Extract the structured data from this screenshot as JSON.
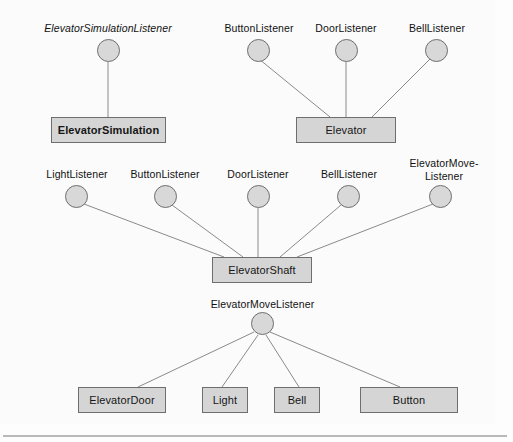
{
  "diagram": {
    "notation": "UML lollipop interface notation",
    "colors": {
      "box_fill": "#d5d5d5",
      "box_stroke": "#6e6e6e",
      "circle_fill": "#d8d8d8",
      "circle_stroke": "#6e6e6e",
      "edge_stroke": "#8a8a8a",
      "background": "#fdfdfd",
      "rule": "#b9b9b9",
      "text": "#161616"
    },
    "groups": [
      {
        "id": "elevator-simulation-group",
        "class_box": {
          "label": "ElevatorSimulation",
          "bold": true
        },
        "interfaces": [
          {
            "label": "ElevatorSimulationListener",
            "italic": true
          }
        ]
      },
      {
        "id": "elevator-group",
        "class_box": {
          "label": "Elevator",
          "bold": false
        },
        "interfaces": [
          {
            "label": "ButtonListener",
            "italic": false
          },
          {
            "label": "DoorListener",
            "italic": false
          },
          {
            "label": "BellListener",
            "italic": false
          }
        ]
      },
      {
        "id": "elevator-shaft-group",
        "class_box": {
          "label": "ElevatorShaft",
          "bold": false
        },
        "interfaces": [
          {
            "label": "LightListener",
            "italic": false
          },
          {
            "label": "ButtonListener",
            "italic": false
          },
          {
            "label": "DoorListener",
            "italic": false
          },
          {
            "label": "BellListener",
            "italic": false
          },
          {
            "label": "ElevatorMove-\nListener",
            "italic": false
          }
        ]
      },
      {
        "id": "elevator-move-listener-group",
        "class_box": null,
        "interfaces": [
          {
            "label": "ElevatorMoveListener",
            "italic": false
          }
        ],
        "implementors": [
          {
            "label": "ElevatorDoor"
          },
          {
            "label": "Light"
          },
          {
            "label": "Bell"
          },
          {
            "label": "Button"
          }
        ]
      }
    ],
    "nodes": {
      "box_elevator_simulation": "ElevatorSimulation",
      "box_elevator": "Elevator",
      "box_elevator_shaft": "ElevatorShaft",
      "box_elevator_door": "ElevatorDoor",
      "box_light": "Light",
      "box_bell": "Bell",
      "box_button": "Button",
      "iface_elevator_simulation_listener": "ElevatorSimulationListener",
      "iface_button_listener_top": "ButtonListener",
      "iface_door_listener_top": "DoorListener",
      "iface_bell_listener_top": "BellListener",
      "iface_light_listener_mid": "LightListener",
      "iface_button_listener_mid": "ButtonListener",
      "iface_door_listener_mid": "DoorListener",
      "iface_bell_listener_mid": "BellListener",
      "iface_elevator_move_listener_mid": "ElevatorMove-\nListener",
      "iface_elevator_move_listener_bottom": "ElevatorMoveListener"
    }
  }
}
